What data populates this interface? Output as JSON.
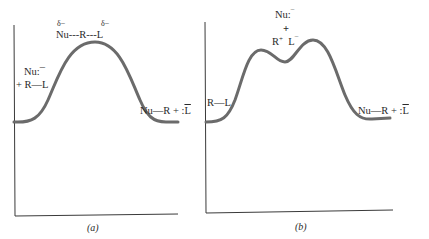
{
  "panels": [
    {
      "id": "a",
      "caption": "(a)",
      "transition_state": {
        "delta_left": "δ−",
        "delta_right": "δ−",
        "label": "Nu---R---L"
      },
      "reactants": {
        "line1": "Nu:¯",
        "line2": "+ R—L"
      },
      "products": {
        "left": "Nu—R + :",
        "leaving": "L",
        "charge": "¯"
      }
    },
    {
      "id": "b",
      "caption": "(b)",
      "intermediate": {
        "line1": "Nu:",
        "line1_charge": "¯",
        "plus": "+",
        "cation": "R",
        "cation_charge": "+",
        "anion": "L",
        "anion_charge": "¯"
      },
      "reactants": {
        "line1": "R—L"
      },
      "products": {
        "left": "Nu—R + :",
        "leaving": "L",
        "charge": "¯"
      }
    }
  ],
  "colors": {
    "curve": "#6b6b6b",
    "axis": "#3a3a3a"
  }
}
